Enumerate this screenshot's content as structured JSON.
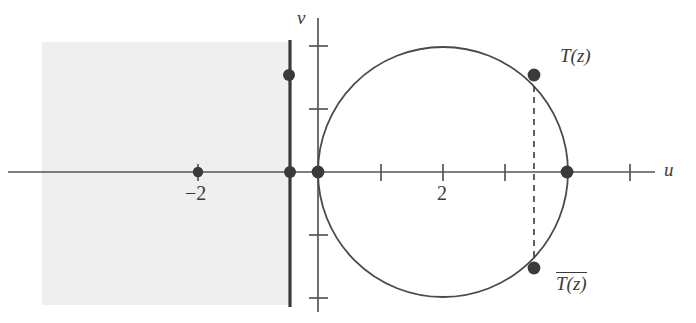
{
  "figure": {
    "width": 696,
    "height": 323,
    "background_color": "#ffffff",
    "ink_color": "#3a3a3a",
    "shade_color": "#efefef"
  },
  "axes": {
    "horizontal": {
      "name": "u",
      "label": "u",
      "y_pixel": 172,
      "x_start": 8,
      "x_end": 655
    },
    "vertical": {
      "name": "v",
      "label": "v",
      "x_pixel": 318,
      "y_start": 18,
      "y_end": 312
    },
    "unit_pixels": 42,
    "origin": {
      "x": 318,
      "y": 172
    }
  },
  "ticks": {
    "u_axis": [
      {
        "label": "",
        "value": -2.85,
        "x": 198
      },
      {
        "label": "",
        "value": 1,
        "x": 381
      },
      {
        "label": "2",
        "value": 2,
        "x": 443
      },
      {
        "label": "",
        "value": 3,
        "x": 505
      },
      {
        "label": "",
        "value": 5,
        "x": 630
      }
    ],
    "v_axis": [
      {
        "label": "",
        "value": 2,
        "y": 46
      },
      {
        "label": "",
        "value": 1,
        "y": 109
      },
      {
        "label": "",
        "value": -1,
        "y": 235
      },
      {
        "label": "",
        "value": -2,
        "y": 298
      }
    ],
    "u_label_2": "2",
    "u_label_minus2": "−2"
  },
  "shaded_region": {
    "name": "half-plane-shading",
    "x": 42,
    "y": 42,
    "width": 248,
    "height": 263,
    "fill": "#efefef"
  },
  "boundary_line": {
    "name": "vertical-boundary-line",
    "x": 290,
    "y_top": 40,
    "y_bottom": 307,
    "stroke": "#3a3a3a",
    "stroke_width": 3.2
  },
  "circle": {
    "name": "image-circle",
    "center_x": 443,
    "center_y": 172,
    "radius": 125,
    "stroke": "#4a4a4a",
    "stroke_width": 1.8,
    "fill": "none"
  },
  "dashed_chord": {
    "name": "vertical-dashed-chord",
    "x": 534,
    "y_top": 75,
    "y_bottom": 268,
    "stroke": "#3a3a3a",
    "dash": "6,5"
  },
  "points": [
    {
      "name": "point-minus-2",
      "x": 198,
      "y": 172,
      "label": "−2",
      "radius": 5.2
    },
    {
      "name": "point-boundary-origin",
      "x": 290,
      "y": 172,
      "label": "",
      "radius": 6.0
    },
    {
      "name": "point-origin",
      "x": 318,
      "y": 172,
      "label": "",
      "radius": 6.4
    },
    {
      "name": "point-on-boundary-line",
      "x": 289,
      "y": 75,
      "label": "",
      "radius": 6.0
    },
    {
      "name": "point-circle-right",
      "x": 567,
      "y": 172,
      "label": "",
      "radius": 6.4
    },
    {
      "name": "point-Tz",
      "x": 534,
      "y": 75,
      "label": "T(z)",
      "radius": 6.4
    },
    {
      "name": "point-Tz-conjugate",
      "x": 534,
      "y": 268,
      "label": "T(z)",
      "radius": 6.4
    }
  ],
  "labels": {
    "u_axis": "u",
    "v_axis": "v",
    "tick_two": "2",
    "tick_minus_two": "−2",
    "Tz": "T(z)",
    "Tz_conjugate": "T(z)"
  }
}
